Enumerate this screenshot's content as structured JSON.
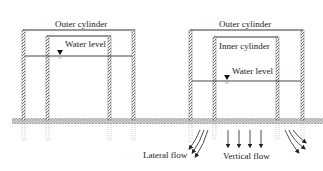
{
  "left_diagram": {
    "outer_label": "Outer cylinder",
    "water_label": "Water level"
  },
  "right_diagram": {
    "outer_label": "Outer cylinder",
    "inner_label": "Inner cylinder",
    "water_label": "Water level",
    "lateral_label": "Lateral flow",
    "vertical_label": "Vertical flow"
  },
  "colors": {
    "line": "#333333",
    "wall_hatch": "#555555",
    "ground": "#bdbdbd"
  }
}
